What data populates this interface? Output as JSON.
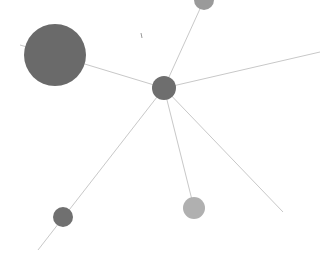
{
  "graph": {
    "background": "#ffffff",
    "edge_color": "#c8c8c8",
    "nodes": [
      {
        "id": "hub",
        "x": 164,
        "y": 88,
        "r": 12,
        "color": "#6e6e6e"
      },
      {
        "id": "large",
        "x": 55,
        "y": 55,
        "r": 31,
        "color": "#6a6a6a"
      },
      {
        "id": "top",
        "x": 204,
        "y": 0,
        "r": 10,
        "color": "#9a9a9a"
      },
      {
        "id": "bottom-mid",
        "x": 194,
        "y": 208,
        "r": 11,
        "color": "#b0b0b0"
      },
      {
        "id": "bottom-left",
        "x": 63,
        "y": 217,
        "r": 10,
        "color": "#707070"
      }
    ],
    "edges": [
      {
        "from": [
          164,
          88
        ],
        "to": [
          55,
          55
        ]
      },
      {
        "from": [
          164,
          88
        ],
        "to": [
          204,
          0
        ]
      },
      {
        "from": [
          164,
          88
        ],
        "to": [
          320,
          52
        ]
      },
      {
        "from": [
          164,
          88
        ],
        "to": [
          194,
          208
        ]
      },
      {
        "from": [
          164,
          88
        ],
        "to": [
          283,
          212
        ]
      },
      {
        "from": [
          164,
          88
        ],
        "to": [
          38,
          250
        ]
      },
      {
        "from": [
          55,
          55
        ],
        "to": [
          20,
          45
        ]
      }
    ]
  }
}
